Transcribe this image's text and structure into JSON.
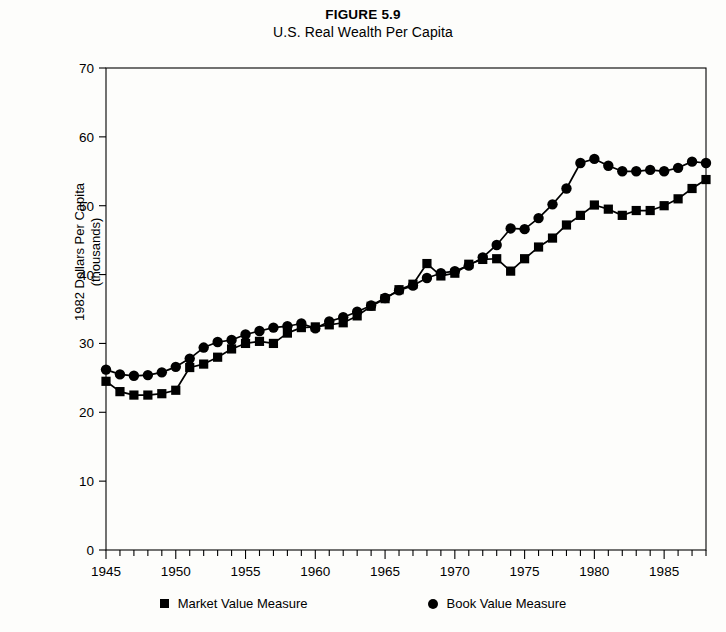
{
  "figure": {
    "number_label": "FIGURE 5.9",
    "subtitle": "U.S. Real Wealth Per Capita",
    "y_axis_label_line1": "1982 Dollars Per Capita",
    "y_axis_label_line2": "(thousands)"
  },
  "legend": {
    "market_label": "Market Value Measure",
    "book_label": "Book Value Measure",
    "market_marker": "square-marker",
    "book_marker": "circle-marker"
  },
  "colors": {
    "ink": "#000000",
    "background": "#fdfdfb",
    "axis": "#000000"
  },
  "chart_data": {
    "type": "line",
    "title": "U.S. Real Wealth Per Capita",
    "subtitle": "FIGURE 5.9",
    "xlabel": "",
    "ylabel": "1982 Dollars Per Capita (thousands)",
    "xlim": [
      1945,
      1988
    ],
    "ylim": [
      0,
      70
    ],
    "yticks": [
      0,
      10,
      20,
      30,
      40,
      50,
      60,
      70
    ],
    "xticks": [
      1945,
      1950,
      1955,
      1960,
      1965,
      1970,
      1975,
      1980,
      1985
    ],
    "xtick_minor_step": 1,
    "grid": false,
    "legend_position": "below",
    "x": [
      1945,
      1946,
      1947,
      1948,
      1949,
      1950,
      1951,
      1952,
      1953,
      1954,
      1955,
      1956,
      1957,
      1958,
      1959,
      1960,
      1961,
      1962,
      1963,
      1964,
      1965,
      1966,
      1967,
      1968,
      1969,
      1970,
      1971,
      1972,
      1973,
      1974,
      1975,
      1976,
      1977,
      1978,
      1979,
      1980,
      1981,
      1982,
      1983,
      1984,
      1985,
      1986,
      1987,
      1988
    ],
    "series": [
      {
        "name": "Market Value Measure",
        "marker": "square",
        "values": [
          24.5,
          23.0,
          22.5,
          22.5,
          22.7,
          23.2,
          26.5,
          27.0,
          28.0,
          29.2,
          30.0,
          30.3,
          30.0,
          31.5,
          32.3,
          32.4,
          32.7,
          33.0,
          34.0,
          35.4,
          36.5,
          37.8,
          38.6,
          41.6,
          39.8,
          40.2,
          41.5,
          42.2,
          42.3,
          40.5,
          42.3,
          44.0,
          45.3,
          47.2,
          48.6,
          50.1,
          49.5,
          48.6,
          49.3,
          49.3,
          50.0,
          51.0,
          52.5,
          53.8
        ]
      },
      {
        "name": "Book Value Measure",
        "marker": "circle",
        "values": [
          26.2,
          25.5,
          25.3,
          25.4,
          25.8,
          26.6,
          27.8,
          29.4,
          30.2,
          30.5,
          31.3,
          31.8,
          32.3,
          32.5,
          32.9,
          32.2,
          33.2,
          33.8,
          34.6,
          35.5,
          36.6,
          37.7,
          38.4,
          39.5,
          40.2,
          40.5,
          41.3,
          42.5,
          44.3,
          46.7,
          46.6,
          48.2,
          50.2,
          52.5,
          56.2,
          56.8,
          55.8,
          55.0,
          55.0,
          55.2,
          55.0,
          55.5,
          56.4,
          56.2
        ]
      }
    ]
  }
}
